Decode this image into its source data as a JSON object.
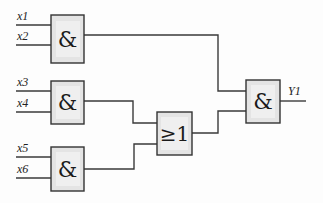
{
  "diagram": {
    "type": "logic-circuit",
    "inputs": [
      {
        "id": "x1",
        "label": "x1"
      },
      {
        "id": "x2",
        "label": "x2"
      },
      {
        "id": "x3",
        "label": "x3"
      },
      {
        "id": "x4",
        "label": "x4"
      },
      {
        "id": "x5",
        "label": "x5"
      },
      {
        "id": "x6",
        "label": "x6"
      }
    ],
    "gates": [
      {
        "id": "and1",
        "kind": "AND",
        "symbol": "&",
        "inputs": [
          "x1",
          "x2"
        ]
      },
      {
        "id": "and2",
        "kind": "AND",
        "symbol": "&",
        "inputs": [
          "x3",
          "x4"
        ]
      },
      {
        "id": "and3",
        "kind": "AND",
        "symbol": "&",
        "inputs": [
          "x5",
          "x6"
        ]
      },
      {
        "id": "or1",
        "kind": "OR",
        "symbol": "≥1",
        "inputs": [
          "and2",
          "and3"
        ]
      },
      {
        "id": "and4",
        "kind": "AND",
        "symbol": "&",
        "inputs": [
          "and1",
          "or1"
        ]
      }
    ],
    "output": {
      "id": "Y1",
      "label": "Y1",
      "source": "and4"
    }
  }
}
